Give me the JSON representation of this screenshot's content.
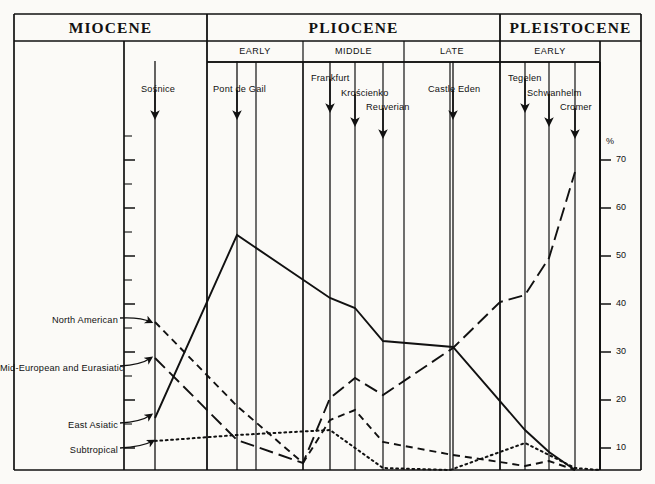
{
  "figure": {
    "axis_unit": "%",
    "epochs": [
      {
        "name": "MIOCENE",
        "x0": 14,
        "x1": 207
      },
      {
        "name": "PLIOCENE",
        "x0": 207,
        "x1": 500
      },
      {
        "name": "PLEISTOCENE",
        "x0": 500,
        "x1": 641
      }
    ],
    "stages": [
      {
        "name": "EARLY",
        "x0": 207,
        "x1": 303
      },
      {
        "name": "MIDDLE",
        "x0": 303,
        "x1": 404
      },
      {
        "name": "LATE",
        "x0": 404,
        "x1": 500
      },
      {
        "name": "EARLY",
        "x0": 500,
        "x1": 600
      }
    ],
    "sites": [
      {
        "name": "Sośnice",
        "x": 155,
        "label_x": 141,
        "label_y": 84,
        "arrow_y0": 90,
        "arrow_y1": 117
      },
      {
        "name": "Pont de Gail",
        "x": 237,
        "label_x": 213,
        "label_y": 84,
        "arrow_y0": 90,
        "arrow_y1": 117
      },
      {
        "name": "Frankfurt",
        "x": 330,
        "label_x": 311,
        "label_y": 73,
        "arrow_y0": 79,
        "arrow_y1": 110
      },
      {
        "name": "Krościenko",
        "x": 355,
        "label_x": 341,
        "label_y": 88,
        "arrow_y0": 94,
        "arrow_y1": 124
      },
      {
        "name": "Reuverian",
        "x": 383,
        "label_x": 366,
        "label_y": 102,
        "arrow_y0": 108,
        "arrow_y1": 136
      },
      {
        "name": "Castle Eden",
        "x": 453,
        "label_x": 428,
        "label_y": 84,
        "arrow_y0": 90,
        "arrow_y1": 117
      },
      {
        "name": "Tegelen",
        "x": 525,
        "label_x": 508,
        "label_y": 73,
        "arrow_y0": 79,
        "arrow_y1": 110
      },
      {
        "name": "Schwanhelm",
        "x": 549,
        "label_x": 527,
        "label_y": 88,
        "arrow_y0": 94,
        "arrow_y1": 124
      },
      {
        "name": "Cromer",
        "x": 575,
        "label_x": 560,
        "label_y": 102,
        "arrow_y0": 108,
        "arrow_y1": 136
      }
    ],
    "curve_labels": [
      {
        "name": "North American",
        "x": 118,
        "y": 321,
        "arrow_to_x": 155,
        "arrow_to_y": 322
      },
      {
        "name": "Mid-European and Eurasiatic",
        "x": 118,
        "y": 369,
        "arrow_to_x": 155,
        "arrow_to_y": 358
      },
      {
        "name": "East Asiatic",
        "x": 118,
        "y": 426,
        "arrow_to_x": 155,
        "arrow_to_y": 415
      },
      {
        "name": "Subtropical",
        "x": 118,
        "y": 451,
        "arrow_to_x": 157,
        "arrow_to_y": 441
      }
    ],
    "y_ticks": [
      {
        "value": "70",
        "y": 160
      },
      {
        "value": "60",
        "y": 208
      },
      {
        "value": "50",
        "y": 256
      },
      {
        "value": "40",
        "y": 304
      },
      {
        "value": "30",
        "y": 352
      },
      {
        "value": "20",
        "y": 400
      },
      {
        "value": "10",
        "y": 448
      }
    ],
    "gridline_x": [
      207,
      256,
      303,
      355,
      383,
      450,
      500,
      525,
      549,
      575,
      600
    ],
    "site_line_x": [
      155,
      237,
      330,
      453
    ],
    "colors": {
      "ink": "#111111",
      "paper": "#fbfaf7"
    }
  },
  "chart_data": {
    "type": "line",
    "title": "",
    "xlabel": "",
    "ylabel": "%",
    "ylim": [
      0,
      75
    ],
    "grid": true,
    "legend_position": "left-inline",
    "x_categories": [
      "Sośnice",
      "Pont de Gail",
      "Frankfurt",
      "Krościenko",
      "Reuverian",
      "Castle Eden",
      "Tegelen",
      "Schwanhelm",
      "Cromer"
    ],
    "x_pixels": [
      155,
      237,
      330,
      355,
      383,
      453,
      525,
      549,
      575
    ],
    "series": [
      {
        "name": "East Asiatic",
        "style": "solid",
        "values": [
          12,
          53,
          40,
          38,
          31,
          30,
          13,
          7,
          0
        ],
        "points_px": [
          [
            155,
            418
          ],
          [
            237,
            235
          ],
          [
            330,
            298
          ],
          [
            355,
            308
          ],
          [
            383,
            341
          ],
          [
            453,
            347
          ],
          [
            525,
            430
          ],
          [
            549,
            452
          ],
          [
            575,
            470
          ]
        ]
      },
      {
        "name": "Mid-European and Eurasiatic",
        "style": "dash-dot",
        "values": [
          25,
          7,
          2,
          14,
          22,
          19,
          29,
          39,
          50,
          67
        ],
        "points_px": [
          [
            155,
            358
          ],
          [
            237,
            440
          ],
          [
            303,
            463
          ],
          [
            330,
            398
          ],
          [
            355,
            378
          ],
          [
            383,
            395
          ],
          [
            453,
            348
          ],
          [
            500,
            302
          ],
          [
            525,
            295
          ],
          [
            549,
            258
          ],
          [
            575,
            172
          ]
        ]
      },
      {
        "name": "North American",
        "style": "dashed",
        "values": [
          34,
          13,
          1,
          20,
          22,
          14,
          5,
          3,
          3,
          1
        ],
        "points_px": [
          [
            155,
            322
          ],
          [
            237,
            406
          ],
          [
            303,
            463
          ],
          [
            330,
            420
          ],
          [
            355,
            410
          ],
          [
            383,
            442
          ],
          [
            453,
            455
          ],
          [
            500,
            462
          ],
          [
            525,
            466
          ],
          [
            549,
            461
          ],
          [
            575,
            470
          ]
        ]
      },
      {
        "name": "Subtropical",
        "style": "dotted",
        "values": [
          7,
          8,
          9,
          0,
          0,
          5,
          2,
          0,
          0
        ],
        "points_px": [
          [
            155,
            441
          ],
          [
            237,
            435
          ],
          [
            330,
            430
          ],
          [
            383,
            468
          ],
          [
            450,
            470
          ],
          [
            525,
            443
          ],
          [
            575,
            468
          ],
          [
            600,
            470
          ]
        ]
      }
    ]
  }
}
